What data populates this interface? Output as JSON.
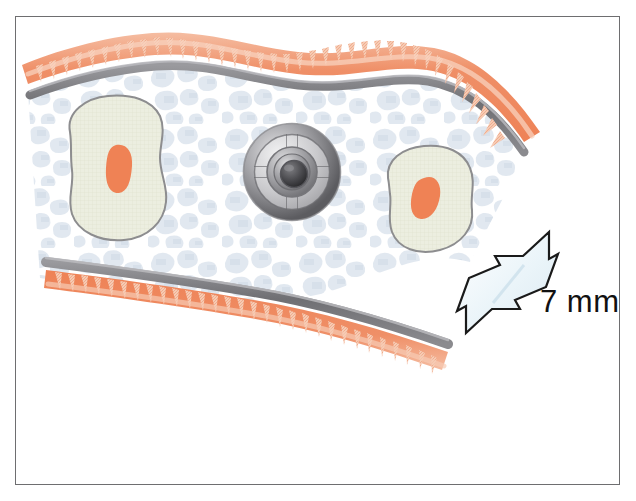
{
  "figure": {
    "name": "tissue-cross-section-with-implant",
    "frame": {
      "border_color": "#6e6e70",
      "background_color": "#ffffff"
    }
  },
  "scale_bar": {
    "label": "7 mm",
    "arrow_name": "double-headed-scale-arrow",
    "arrow_fill": "#eef6fa",
    "arrow_stroke": "#1a1a1a"
  },
  "legend_colors": {
    "mucosa_orange": "#ef8f67",
    "mucosa_pale": "#f7c4ab",
    "cortical_gray": "#76767a",
    "bone_island_fill": "#eceee0",
    "bone_island_stroke": "#8d8d8f",
    "marrow_orange": "#ef8255",
    "trabecular_blue": "#e3e9f1",
    "implant_metal_light": "#d8d8da",
    "implant_metal_dark": "#58585a",
    "implant_core_dark": "#2e2e30"
  },
  "structures": [
    {
      "id": "upper-mucosa-layer",
      "label": "upper mucosal epithelium with rete pegs"
    },
    {
      "id": "upper-cortical-plate",
      "label": "upper cortical bone plate"
    },
    {
      "id": "cancellous-bone-field",
      "label": "cancellous / trabecular bone field"
    },
    {
      "id": "bone-island-left",
      "label": "left bone island"
    },
    {
      "id": "bone-island-left-marrow",
      "label": "left bone island marrow space"
    },
    {
      "id": "bone-island-right",
      "label": "right bone island"
    },
    {
      "id": "bone-island-right-marrow",
      "label": "right bone island marrow space"
    },
    {
      "id": "metal-implant-disc",
      "label": "central metallic disc implant with four spokes"
    },
    {
      "id": "lower-cortical-plate",
      "label": "lower cortical bone plate"
    },
    {
      "id": "lower-mucosa-layer",
      "label": "lower mucosal epithelium with rete pegs"
    }
  ]
}
